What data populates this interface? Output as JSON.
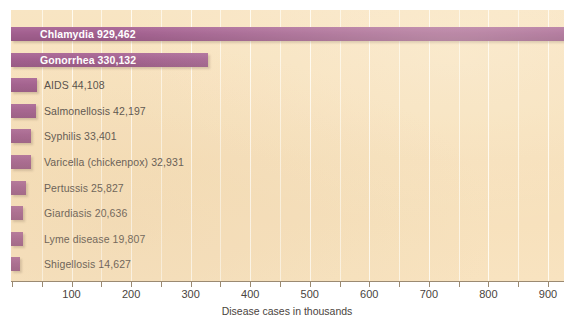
{
  "chart_data": {
    "type": "bar",
    "orientation": "horizontal",
    "title": "",
    "xlabel": "Disease cases in thousands",
    "ylabel": "",
    "xlim": [
      0,
      950
    ],
    "xticks": [
      100,
      200,
      300,
      400,
      500,
      600,
      700,
      800,
      900
    ],
    "xtick_labels": [
      "100",
      "200",
      "300",
      "400",
      "500",
      "600",
      "700",
      "800",
      "900"
    ],
    "minor_gridline_step": 50,
    "grid": true,
    "legend": "none",
    "units": "thousands of cases",
    "bar_color": "#8e3d77",
    "plot_background": "#f5dcb0",
    "categories": [
      "Chlamydia",
      "Gonorrhea",
      "AIDS",
      "Salmonellosis",
      "Syphilis",
      "Varicella (chickenpox)",
      "Pertussis",
      "Giardiasis",
      "Lyme disease",
      "Shigellosis"
    ],
    "values": [
      929.462,
      330.132,
      44.108,
      42.197,
      33.401,
      32.931,
      25.827,
      20.636,
      19.807,
      14.627
    ],
    "bars": [
      {
        "name": "Chlamydia",
        "label": "Chlamydia  929,462",
        "value_cases": 929462,
        "value_thousands": 929.462,
        "label_position": "inside"
      },
      {
        "name": "Gonorrhea",
        "label": "Gonorrhea  330,132",
        "value_cases": 330132,
        "value_thousands": 330.132,
        "label_position": "inside"
      },
      {
        "name": "AIDS",
        "label": "AIDS  44,108",
        "value_cases": 44108,
        "value_thousands": 44.108,
        "label_position": "outside"
      },
      {
        "name": "Salmonellosis",
        "label": "Salmonellosis  42,197",
        "value_cases": 42197,
        "value_thousands": 42.197,
        "label_position": "outside"
      },
      {
        "name": "Syphilis",
        "label": "Syphilis  33,401",
        "value_cases": 33401,
        "value_thousands": 33.401,
        "label_position": "outside"
      },
      {
        "name": "Varicella (chickenpox)",
        "label": "Varicella (chickenpox)  32,931",
        "value_cases": 32931,
        "value_thousands": 32.931,
        "label_position": "outside"
      },
      {
        "name": "Pertussis",
        "label": "Pertussis  25,827",
        "value_cases": 25827,
        "value_thousands": 25.827,
        "label_position": "outside"
      },
      {
        "name": "Giardiasis",
        "label": "Giardiasis  20,636",
        "value_cases": 20636,
        "value_thousands": 20.636,
        "label_position": "outside"
      },
      {
        "name": "Lyme disease",
        "label": "Lyme disease 19,807",
        "value_cases": 19807,
        "value_thousands": 19.807,
        "label_position": "outside"
      },
      {
        "name": "Shigellosis",
        "label": "Shigellosis 14,627",
        "value_cases": 14627,
        "value_thousands": 14.627,
        "label_position": "outside"
      }
    ]
  }
}
